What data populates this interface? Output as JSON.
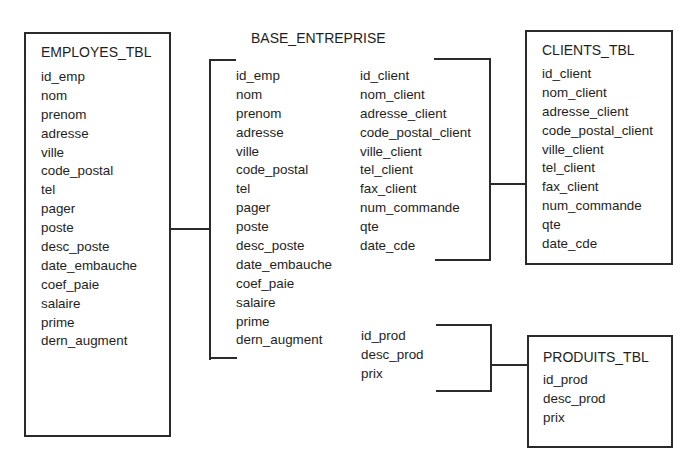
{
  "diagram": {
    "type": "database-schema",
    "central": {
      "title": "BASE_ENTREPRISE",
      "employee_fields": [
        "id_emp",
        "nom",
        "prenom",
        "adresse",
        "ville",
        "code_postal",
        "tel",
        "pager",
        "poste",
        "desc_poste",
        "date_embauche",
        "coef_paie",
        "salaire",
        "prime",
        "dern_augment"
      ],
      "client_fields": [
        "id_client",
        "nom_client",
        "adresse_client",
        "code_postal_client",
        "ville_client",
        "tel_client",
        "fax_client",
        "num_commande",
        "qte",
        "date_cde"
      ],
      "product_fields": [
        "id_prod",
        "desc_prod",
        "prix"
      ]
    },
    "tables": {
      "employes": {
        "title": "EMPLOYES_TBL",
        "fields": [
          "id_emp",
          "nom",
          "prenom",
          "adresse",
          "ville",
          "code_postal",
          "tel",
          "pager",
          "poste",
          "desc_poste",
          "date_embauche",
          "coef_paie",
          "salaire",
          "prime",
          "dern_augment"
        ]
      },
      "clients": {
        "title": "CLIENTS_TBL",
        "fields": [
          "id_client",
          "nom_client",
          "adresse_client",
          "code_postal_client",
          "ville_client",
          "tel_client",
          "fax_client",
          "num_commande",
          "qte",
          "date_cde"
        ]
      },
      "produits": {
        "title": "PRODUITS_TBL",
        "fields": [
          "id_prod",
          "desc_prod",
          "prix"
        ]
      }
    },
    "connections": [
      {
        "from": "EMPLOYES_TBL",
        "to": "BASE_ENTREPRISE.employee_fields"
      },
      {
        "from": "BASE_ENTREPRISE.client_fields",
        "to": "CLIENTS_TBL"
      },
      {
        "from": "BASE_ENTREPRISE.product_fields",
        "to": "PRODUITS_TBL"
      }
    ],
    "colors": {
      "line": "#2a2a2a",
      "text": "#1e1e1e",
      "background": "#ffffff"
    }
  }
}
